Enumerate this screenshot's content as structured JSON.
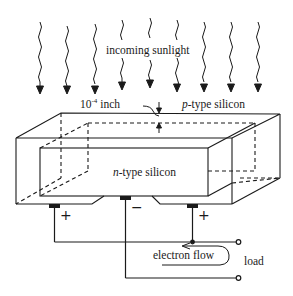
{
  "diagram": {
    "labels": {
      "sunlight": "incoming sunlight",
      "thickness_base": "10",
      "thickness_exp": "-4",
      "thickness_unit": " inch",
      "p_italic": "p",
      "p_rest": "-type silicon",
      "n_italic": "n",
      "n_rest": "-type silicon",
      "electron_flow": "electron flow",
      "load": "load"
    },
    "contacts": [
      {
        "position": "left",
        "polarity": "+"
      },
      {
        "position": "middle",
        "polarity": "−"
      },
      {
        "position": "right",
        "polarity": "+"
      }
    ],
    "sunlight_ray_count": 9,
    "colors": {
      "line": "#1a1a1a",
      "background": "#ffffff"
    }
  }
}
